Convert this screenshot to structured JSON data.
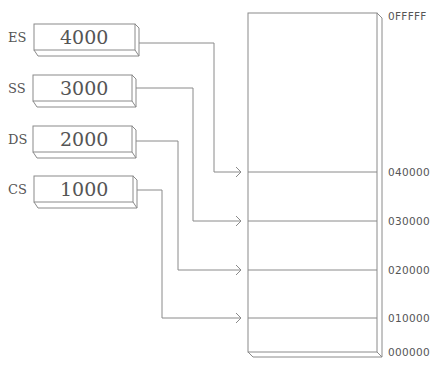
{
  "diagram": {
    "type": "segment-register-memory-map",
    "registers": [
      {
        "name": "ES",
        "value": "4000",
        "points_to": "040000"
      },
      {
        "name": "SS",
        "value": "3000",
        "points_to": "030000"
      },
      {
        "name": "DS",
        "value": "2000",
        "points_to": "020000"
      },
      {
        "name": "CS",
        "value": "1000",
        "points_to": "010000"
      }
    ],
    "memory": {
      "top_address": "0FFFFF",
      "bottom_address": "000000",
      "addresses": [
        "040000",
        "030000",
        "020000",
        "010000"
      ]
    }
  },
  "colors": {
    "line": "#8a8a8a",
    "text": "#555555",
    "background": "#ffffff"
  }
}
